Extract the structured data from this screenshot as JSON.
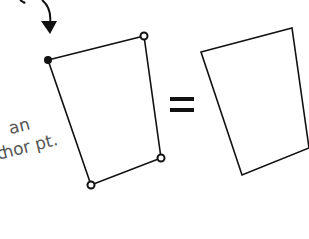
{
  "annotation": {
    "line1": "an",
    "line2": "hor pt.",
    "partial_prefix1": "t",
    "partial_prefix2": "c"
  },
  "operator": "=",
  "colors": {
    "stroke": "#111111",
    "handwriting": "#555555",
    "background": "#ffffff"
  },
  "left_shape": {
    "anchor_point": [
      48,
      60
    ],
    "handle_points": [
      [
        144,
        36
      ],
      [
        161,
        158
      ],
      [
        91,
        185
      ]
    ]
  },
  "right_shape": {
    "points": [
      [
        201,
        52
      ],
      [
        292,
        28
      ],
      [
        309,
        148
      ],
      [
        242,
        175
      ]
    ]
  }
}
